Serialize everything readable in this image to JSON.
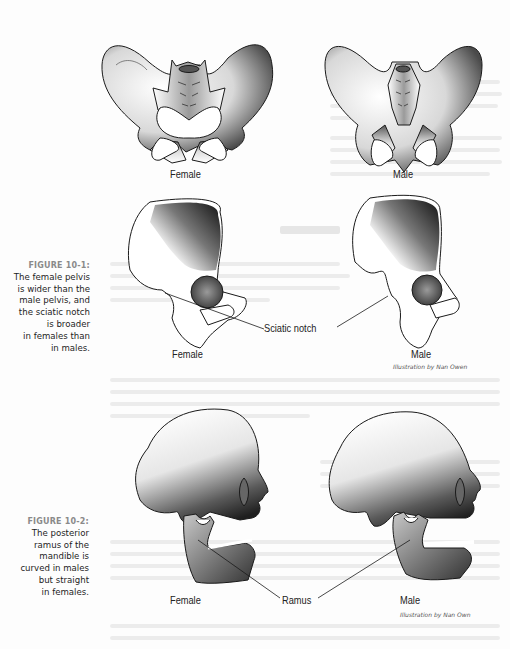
{
  "figure1": {
    "number": "FIGURE 10-1:",
    "caption_lines": [
      "The female pelvis",
      "is wider than the",
      "male pelvis, and",
      "the sciatic notch",
      "is broader",
      "in females than",
      "in males."
    ],
    "top_labels": {
      "left": "Female",
      "right": "Male"
    },
    "bottom_labels": {
      "left": "Female",
      "right": "Male"
    },
    "callout": "Sciatic notch",
    "credit": "Illustration by Nan Owen"
  },
  "figure2": {
    "number": "FIGURE 10-2:",
    "caption_lines": [
      "The posterior",
      "ramus of the",
      "mandible is",
      "curved in males",
      "but straight",
      "in females."
    ],
    "labels": {
      "left": "Female",
      "right": "Male"
    },
    "callout": "Ramus",
    "credit": "Illustration by Nan Own"
  },
  "colors": {
    "figure_number": "#8a8a8a",
    "caption_text": "#1e1e1e",
    "bone_outline": "#1a1a1a",
    "bone_shade_dark": "#2a2a2a"
  }
}
